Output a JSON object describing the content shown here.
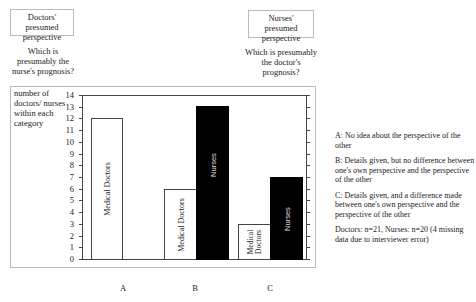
{
  "header": {
    "left_box": "Doctors' presumed perspective",
    "left_question": "Which is presumably the nurse's prognosis?",
    "right_box": "Nurses' presumed perspective",
    "right_question": "Which is presumably the doctor's prognosis?"
  },
  "axis": {
    "ylabel": "number of doctors/ nurses within each category",
    "ticks": [
      "0",
      "1",
      "2",
      "3",
      "4",
      "5",
      "6",
      "7",
      "8",
      "9",
      "10",
      "11",
      "12",
      "13",
      "14"
    ]
  },
  "bars": {
    "A_doctors": {
      "label": "Medical Doctors",
      "value": 12
    },
    "B_doctors": {
      "label": "Medical Doctors",
      "value": 6
    },
    "B_nurses": {
      "label": "Nurses",
      "value": 13
    },
    "C_doctors": {
      "label": "Medical Doctors",
      "value": 3
    },
    "C_nurses": {
      "label": "Nurses",
      "value": 7
    }
  },
  "categories": {
    "A": "A",
    "B": "B",
    "C": "C"
  },
  "legend": {
    "A_key": "A:",
    "A_text": "No idea about the perspective of the other",
    "B_key": "B:",
    "B_text": "Details given, but no difference between one's own perspective and the perspective of the other",
    "C_key": "C:",
    "C_text": "Details given, and a difference made between one's own perspective and the perspective of the other",
    "note": "Doctors: n=21, Nurses: n=20 (4 missing data due to interviewer error)"
  },
  "colors": {
    "doctors_fill": "#ffffff",
    "nurses_fill": "#000000",
    "frame": "#bbbbbb"
  },
  "chart_data": {
    "type": "bar",
    "title": "",
    "categories": [
      "A",
      "B",
      "C"
    ],
    "series": [
      {
        "name": "Medical Doctors",
        "values": [
          12,
          6,
          3
        ]
      },
      {
        "name": "Nurses",
        "values": [
          0,
          13,
          7
        ]
      }
    ],
    "xlabel": "",
    "ylabel": "number of doctors/ nurses within each category",
    "ylim": [
      0,
      14
    ],
    "yticks": [
      0,
      1,
      2,
      3,
      4,
      5,
      6,
      7,
      8,
      9,
      10,
      11,
      12,
      13,
      14
    ],
    "grid": false,
    "legend_position": "right",
    "legend_entries": [
      "A: No idea about the perspective of the other",
      "B: Details given, but no difference between one's own perspective and the perspective of the other",
      "C: Details given, and a difference made between one's own perspective and the perspective of the other"
    ],
    "annotations": [
      "Doctors' presumed perspective — Which is presumably the nurse's prognosis?",
      "Nurses' presumed perspective — Which is presumably the doctor's prognosis?",
      "Doctors: n=21, Nurses: n=20 (4 missing data due to interviewer error)"
    ]
  }
}
